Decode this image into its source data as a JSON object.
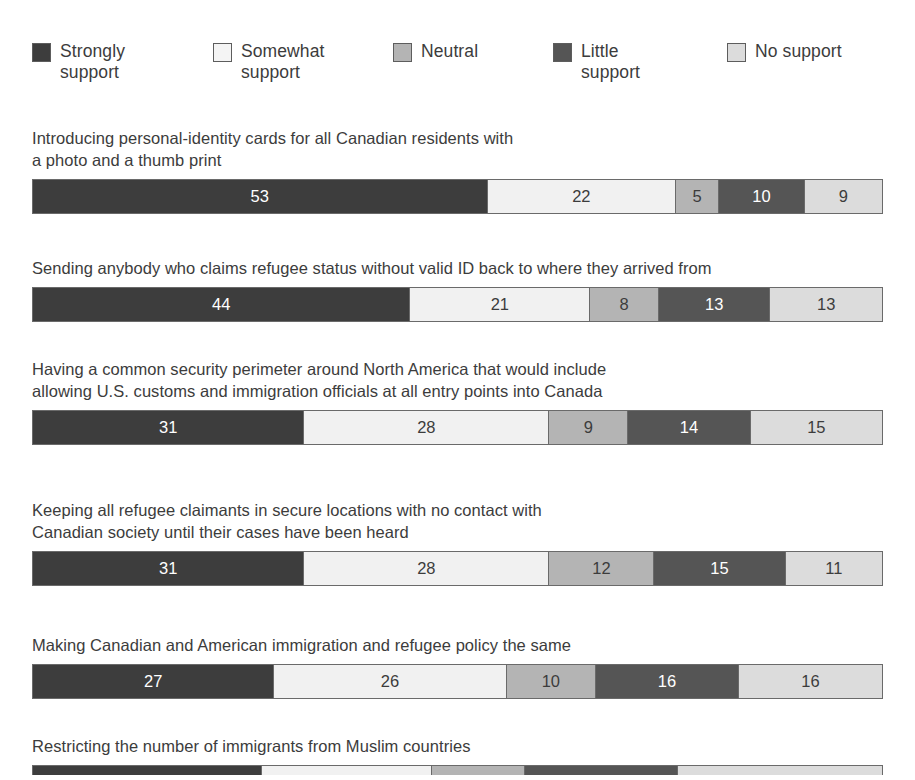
{
  "legend": {
    "items": [
      {
        "label": "Strongly\nsupport",
        "key": "strongly",
        "color": "#3d3d3d",
        "icon": "legend-swatch-icon"
      },
      {
        "label": "Somewhat\nsupport",
        "key": "somewhat",
        "color": "#f4f4f4",
        "icon": "legend-swatch-icon"
      },
      {
        "label": "Neutral",
        "key": "neutral",
        "color": "#b4b4b4",
        "icon": "legend-swatch-icon"
      },
      {
        "label": "Little\nsupport",
        "key": "little",
        "color": "#555555",
        "icon": "legend-swatch-icon"
      },
      {
        "label": "No support",
        "key": "nosupport",
        "color": "#dcdcdc",
        "icon": "legend-swatch-icon"
      }
    ]
  },
  "chart_data": {
    "type": "bar",
    "title": "",
    "subtype": "stacked-horizontal-100",
    "xlabel": "",
    "ylabel": "",
    "xlim": [
      0,
      100
    ],
    "grid": false,
    "legend_position": "top",
    "value_unit": "percent",
    "series": [
      {
        "name": "Strongly support",
        "color": "#3d3d3d",
        "values": [
          53,
          44,
          31,
          31,
          27,
          27
        ]
      },
      {
        "name": "Somewhat support",
        "color": "#f1f1f1",
        "values": [
          22,
          21,
          28,
          28,
          26,
          20
        ]
      },
      {
        "name": "Neutral",
        "color": "#b4b4b4",
        "values": [
          5,
          8,
          9,
          12,
          10,
          11
        ]
      },
      {
        "name": "Little support",
        "color": "#555555",
        "values": [
          10,
          13,
          14,
          15,
          16,
          18
        ]
      },
      {
        "name": "No support",
        "color": "#dcdcdc",
        "values": [
          9,
          13,
          15,
          11,
          16,
          24
        ]
      }
    ],
    "categories": [
      "Introducing personal-identity cards for all Canadian residents with a photo and a thumb print",
      "Sending anybody who claims refugee status without valid ID back to where they arrived from",
      "Having a common security perimeter around North America that would include allowing U.S. customs and immigration officials at all entry points into Canada",
      "Keeping all refugee claimants in secure locations with no contact with Canadian society until their cases have been heard",
      "Making Canadian and American immigration and refugee policy the same",
      "Restricting the number of immigrants from Muslim countries"
    ]
  },
  "questions": [
    {
      "text": "Introducing personal-identity cards for all Canadian residents with\na photo and a thumb print",
      "top": 127,
      "clipped": false,
      "segments": [
        {
          "key": "strongly",
          "value": "53",
          "pct": 53
        },
        {
          "key": "somewhat",
          "value": "22",
          "pct": 22
        },
        {
          "key": "neutral",
          "value": "5",
          "pct": 5
        },
        {
          "key": "little",
          "value": "10",
          "pct": 10
        },
        {
          "key": "nosupport",
          "value": "9",
          "pct": 9
        }
      ]
    },
    {
      "text": "Sending anybody who claims refugee status without valid ID back to where they arrived from",
      "top": 257,
      "clipped": false,
      "segments": [
        {
          "key": "strongly",
          "value": "44",
          "pct": 44
        },
        {
          "key": "somewhat",
          "value": "21",
          "pct": 21
        },
        {
          "key": "neutral",
          "value": "8",
          "pct": 8
        },
        {
          "key": "little",
          "value": "13",
          "pct": 13
        },
        {
          "key": "nosupport",
          "value": "13",
          "pct": 13
        }
      ]
    },
    {
      "text": "Having a common security perimeter around North America that would include\nallowing U.S. customs and immigration officials at all entry points into Canada",
      "top": 358,
      "clipped": false,
      "segments": [
        {
          "key": "strongly",
          "value": "31",
          "pct": 31
        },
        {
          "key": "somewhat",
          "value": "28",
          "pct": 28
        },
        {
          "key": "neutral",
          "value": "9",
          "pct": 9
        },
        {
          "key": "little",
          "value": "14",
          "pct": 14
        },
        {
          "key": "nosupport",
          "value": "15",
          "pct": 15
        }
      ]
    },
    {
      "text": "Keeping all refugee claimants in secure locations with no contact with\nCanadian society until their cases have been heard",
      "top": 499,
      "clipped": false,
      "segments": [
        {
          "key": "strongly",
          "value": "31",
          "pct": 31
        },
        {
          "key": "somewhat",
          "value": "28",
          "pct": 28
        },
        {
          "key": "neutral",
          "value": "12",
          "pct": 12
        },
        {
          "key": "little",
          "value": "15",
          "pct": 15
        },
        {
          "key": "nosupport",
          "value": "11",
          "pct": 11
        }
      ]
    },
    {
      "text": "Making Canadian and American immigration and refugee policy the same",
      "top": 634,
      "clipped": false,
      "segments": [
        {
          "key": "strongly",
          "value": "27",
          "pct": 27
        },
        {
          "key": "somewhat",
          "value": "26",
          "pct": 26
        },
        {
          "key": "neutral",
          "value": "10",
          "pct": 10
        },
        {
          "key": "little",
          "value": "16",
          "pct": 16
        },
        {
          "key": "nosupport",
          "value": "16",
          "pct": 16
        }
      ]
    },
    {
      "text": "Restricting the number of immigrants from Muslim countries",
      "top": 735,
      "clipped": true,
      "segments": [
        {
          "key": "strongly",
          "value": "27",
          "pct": 27
        },
        {
          "key": "somewhat",
          "value": "20",
          "pct": 20
        },
        {
          "key": "neutral",
          "value": "11",
          "pct": 11
        },
        {
          "key": "little",
          "value": "18",
          "pct": 18
        },
        {
          "key": "nosupport",
          "value": "24",
          "pct": 24
        }
      ]
    }
  ]
}
